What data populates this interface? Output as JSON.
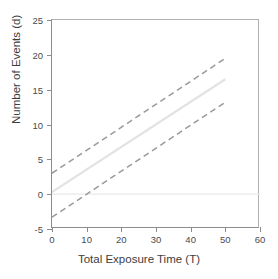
{
  "chart_data": {
    "type": "line",
    "title": "",
    "xlabel": "Total Exposure Time (T)",
    "ylabel": "Number of Events (d)",
    "xlim": [
      0,
      60
    ],
    "ylim": [
      -5,
      25
    ],
    "xticks": [
      0,
      10,
      20,
      30,
      40,
      50,
      60
    ],
    "yticks": [
      -5,
      0,
      5,
      10,
      15,
      20,
      25
    ],
    "grid": false,
    "legend": "none",
    "series": [
      {
        "name": "upper-confidence-bound",
        "style": "dashed",
        "color": "#9a9a9a",
        "x": [
          0,
          50
        ],
        "values": [
          3.0,
          19.5
        ],
        "intercept": 3.0,
        "slope": 0.33
      },
      {
        "name": "fitted-mean",
        "style": "solid",
        "color": "#e3e3e3",
        "x": [
          0,
          50
        ],
        "values": [
          0.3,
          16.5
        ],
        "intercept": 0.3,
        "slope": 0.324
      },
      {
        "name": "lower-confidence-bound",
        "style": "dashed",
        "color": "#9a9a9a",
        "x": [
          0,
          50
        ],
        "values": [
          -3.3,
          13.2
        ],
        "intercept": -3.3,
        "slope": 0.33
      }
    ],
    "reference_lines": [
      {
        "name": "zero-reference-line",
        "orientation": "horizontal",
        "value": 0,
        "style": "solid",
        "color": "#e8e8e8"
      }
    ]
  },
  "axes": {
    "x": {
      "label": "Total Exposure Time (T)",
      "tick_labels": [
        "0",
        "10",
        "20",
        "30",
        "40",
        "50",
        "60"
      ]
    },
    "y": {
      "label": "Number of Events (d)",
      "tick_labels": [
        "-5",
        "0",
        "5",
        "10",
        "15",
        "20",
        "25"
      ]
    }
  },
  "colors": {
    "axis": "#8c8c8c",
    "tick_text": "#4a4a4a",
    "label_text": "#3d3d3d",
    "dashed_line": "#9a9a9a",
    "solid_line": "#e3e3e3",
    "reference_line": "#e8e8e8",
    "background": "#ffffff"
  }
}
